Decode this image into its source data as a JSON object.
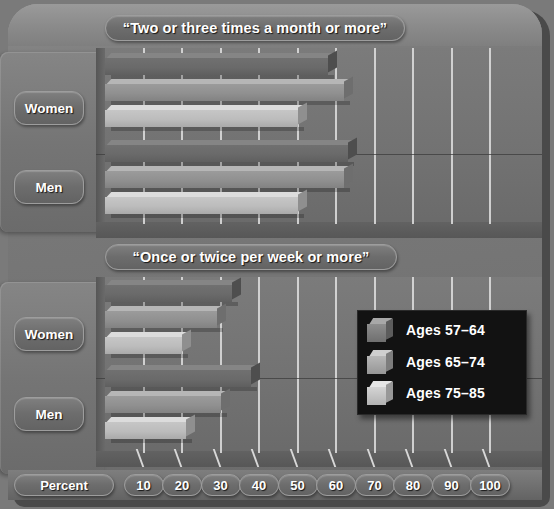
{
  "chart_data": {
    "type": "bar",
    "orientation": "horizontal",
    "title": "",
    "xlabel": "Percent",
    "ylabel": "",
    "xlim": [
      0,
      100
    ],
    "xticks": [
      10,
      20,
      30,
      40,
      50,
      60,
      70,
      80,
      90,
      100
    ],
    "grid": true,
    "legend_position": "inner-right-bottom-panel",
    "series": [
      {
        "name": "Ages 57–64",
        "shade": "#6a6a6a"
      },
      {
        "name": "Ages 65–74",
        "shade": "#909090"
      },
      {
        "name": "Ages 75–85",
        "shade": "#bcbcbc"
      }
    ],
    "panels": [
      {
        "title": "“Two or three times a month or more”",
        "groups": [
          {
            "category": "Women",
            "values": [
              58,
              62,
              50
            ]
          },
          {
            "category": "Men",
            "values": [
              63,
              62,
              50
            ]
          }
        ]
      },
      {
        "title": "“Once or twice per week or more”",
        "groups": [
          {
            "category": "Women",
            "values": [
              33,
              29,
              20
            ]
          },
          {
            "category": "Men",
            "values": [
              38,
              30,
              21
            ]
          }
        ]
      }
    ]
  },
  "panel_titles": {
    "top": "“Two or three times a month or more”",
    "bottom": "“Once or twice per week or more”"
  },
  "category_labels": {
    "women": "Women",
    "men": "Men"
  },
  "legend": {
    "items": [
      {
        "label": "Ages 57–64"
      },
      {
        "label": "Ages 65–74"
      },
      {
        "label": "Ages 75–85"
      }
    ]
  },
  "axis": {
    "label": "Percent",
    "ticks": [
      "10",
      "20",
      "30",
      "40",
      "50",
      "60",
      "70",
      "80",
      "90",
      "100"
    ]
  },
  "colors": {
    "plaque": "#787878",
    "panel": "#727272",
    "gridline": "#d8d8d8",
    "legend_bg": "#121212",
    "text": "#ffffff",
    "series_1": "#6a6a6a",
    "series_2": "#909090",
    "series_3": "#bcbcbc"
  }
}
